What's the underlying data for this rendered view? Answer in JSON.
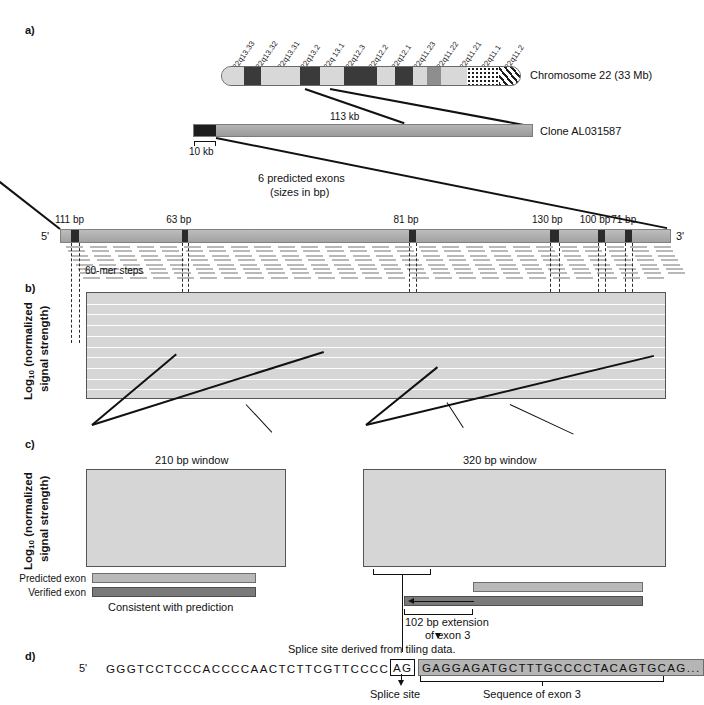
{
  "figure": {
    "panels": [
      "a)",
      "b)",
      "c)",
      "d)"
    ],
    "panel_a_label": "a)",
    "panel_b_label": "b)",
    "panel_c_label": "c)",
    "panel_d_label": "d)"
  },
  "chromosome": {
    "caption": "Chromosome 22 (33 Mb)",
    "bands": [
      "22q13.33",
      "22q13.32",
      "22q13.31",
      "22q13.2",
      "22q 13.1",
      "22q12.3",
      "22q12.2",
      "22q12.1",
      "22q11.23",
      "22q11.22",
      "22q11.21",
      "22q11.1",
      "22q11.2"
    ]
  },
  "clone": {
    "caption": "Clone AL031587",
    "length_label": "113 kb",
    "scale_label": "10 kb"
  },
  "exon_map": {
    "title_line1": "6 predicted exons",
    "title_line2": "(sizes in bp)",
    "five_prime": "5'",
    "three_prime": "3'",
    "steps_label": "60-mer steps",
    "exon_sizes": [
      "111 bp",
      "63 bp",
      "81 bp",
      "130 bp",
      "100 bp",
      "71 bp"
    ]
  },
  "panel_b": {
    "ylabel_line1": "Log",
    "ylabel_sub": "10",
    "ylabel_line2": " (normalized",
    "ylabel_line3": "signal strength)",
    "yticks": [
      "0",
      "0.4",
      "0.8",
      "1.2",
      "1.6"
    ],
    "ytick_values": [
      0,
      0.4,
      0.8,
      1.2,
      1.6
    ],
    "xticks": [
      "10,000",
      "9,000",
      "8,000",
      "7,000",
      "6,000",
      "5,000",
      "4,000",
      "3,000",
      "2,000",
      "1,000",
      "0"
    ],
    "xtick_values": [
      10000,
      9000,
      8000,
      7000,
      6000,
      5000,
      4000,
      3000,
      2000,
      1000,
      0
    ],
    "peak_labels": [
      "Exon 1",
      "2",
      "3",
      "4",
      "5",
      "6 + 3' UTR"
    ]
  },
  "panel_c": {
    "ylabel_line1": "Log",
    "ylabel_sub": "10",
    "ylabel_line2": " (normalized",
    "ylabel_line3": "signal strength)",
    "yticks": [
      "0",
      "0.4",
      "0.8",
      "1.2",
      "1.6"
    ],
    "left_title": "210 bp window",
    "right_title": "320 bp window",
    "legend_predicted": "Predicted exon",
    "legend_verified": "Verified exon",
    "left_conclusion": "Consistent with prediction",
    "extension_line1": "102 bp extension",
    "extension_line2": "of exon 3",
    "splice_note": "Splice site derived from tiling data."
  },
  "panel_d": {
    "five_prime": "5'",
    "upstream_sequence": "GGGTCCTCCCACCCCAACTCTTCGTTCCCC",
    "splice_dinucleotide": "AG",
    "exon_sequence": "GAGGAGATGCTTTGCCCCTACAGTGCAG...",
    "splice_site_label": "Splice site",
    "exon_sequence_label": "Sequence of exon 3"
  },
  "chart_data": [
    {
      "type": "bar",
      "id": "panel-b-tiling-signal",
      "title": "",
      "xlabel": "",
      "ylabel": "Log10 (normalized signal strength)",
      "xlim": [
        10500,
        0
      ],
      "ylim": [
        0,
        1.75
      ],
      "x_reversed": true,
      "grid": true,
      "annotations": [
        "Exon 1",
        "2",
        "3",
        "4",
        "5",
        "6 + 3' UTR"
      ],
      "peaks": [
        {
          "label": "Exon 1",
          "x_center": 10320,
          "width_bp": 111,
          "height": 1.22
        },
        {
          "label": "2",
          "x_center": 8760,
          "width_bp": 63,
          "height": 1.21
        },
        {
          "label": "3",
          "x_center": 4530,
          "width_bp": 183,
          "height": 1.66
        },
        {
          "label": "4",
          "x_center": 2300,
          "width_bp": 130,
          "height": 1.45
        },
        {
          "label": "5",
          "x_center": 1690,
          "width_bp": 100,
          "height": 1.33
        },
        {
          "label": "6a",
          "x_center": 1450,
          "width_bp": 71,
          "height": 1.33
        },
        {
          "label": "6 + 3' UTR",
          "x_center": 1180,
          "width_bp": 330,
          "height": 1.52
        }
      ]
    },
    {
      "type": "bar",
      "id": "panel-c-left-210bp-window",
      "title": "210 bp window",
      "xlabel": "",
      "ylabel": "Log10 (normalized signal strength)",
      "ylim": [
        0,
        1.75
      ],
      "grid": true,
      "categories": [
        "1",
        "2",
        "3",
        "4",
        "5",
        "6",
        "7",
        "8",
        "9",
        "10",
        "11",
        "12",
        "13"
      ],
      "values": [
        1.0,
        1.07,
        1.14,
        1.21,
        1.23,
        1.26,
        1.3,
        1.33,
        1.36,
        1.39,
        1.41,
        1.31,
        1.19
      ]
    },
    {
      "type": "bar",
      "id": "panel-c-right-320bp-window",
      "title": "320 bp window",
      "xlabel": "",
      "ylabel": "Log10 (normalized signal strength)",
      "ylim": [
        0,
        1.75
      ],
      "grid": true,
      "categories": [
        "1",
        "2",
        "3",
        "4",
        "5",
        "6",
        "7",
        "8",
        "9",
        "10",
        "11",
        "12",
        "13",
        "14",
        "15",
        "16",
        "17",
        "18",
        "19",
        "20",
        "21"
      ],
      "values": [
        1.03,
        1.12,
        1.24,
        1.32,
        1.41,
        1.46,
        1.47,
        1.46,
        1.48,
        1.5,
        1.52,
        1.56,
        1.53,
        1.5,
        1.43,
        1.37,
        1.34,
        1.36,
        1.35,
        1.38,
        1.33,
        1.26
      ]
    }
  ]
}
